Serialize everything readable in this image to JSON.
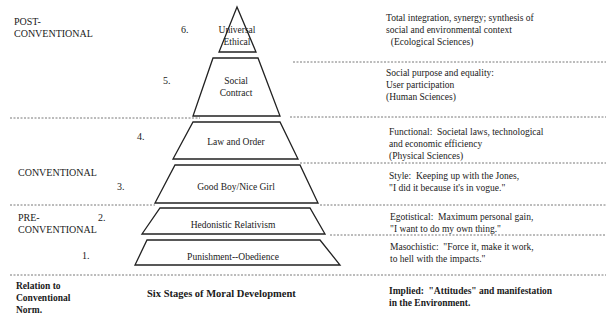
{
  "levels": [
    {
      "id": "post",
      "label_line1": "POST-",
      "label_line2": "CONVENTIONAL"
    },
    {
      "id": "conv",
      "label_line1": "CONVENTIONAL"
    },
    {
      "id": "pre",
      "label_line1": "PRE-",
      "label_line2": "CONVENTIONAL"
    }
  ],
  "stages": [
    {
      "number": "6.",
      "name_line1": "Universal",
      "name_line2": "Ethical",
      "desc": [
        "Total integration, synergy; synthesis of",
        "social and environmental context",
        "  (Ecological Sciences)"
      ]
    },
    {
      "number": "5.",
      "name_line1": "Social",
      "name_line2": "Contract",
      "desc": [
        "Social purpose and equality:",
        "User participation",
        "(Human Sciences)"
      ]
    },
    {
      "number": "4.",
      "name_line1": "Law and Order",
      "desc": [
        "Functional:  Societal laws, technological",
        "and economic efficiency",
        "(Physical Sciences)"
      ]
    },
    {
      "number": "3.",
      "name_line1": "Good Boy/Nice Girl",
      "desc": [
        "Style:  Keeping up with the Jones,",
        "\"I did it because it's in vogue.\""
      ]
    },
    {
      "number": "2.",
      "name_line1": "Hedonistic Relativism",
      "desc": [
        "Egotistical:  Maximum personal gain,",
        "\"I want to do my own thing.\""
      ]
    },
    {
      "number": "1.",
      "name_line1": "Punishment--Obedience",
      "desc": [
        "Masochistic:  \"Force it, make it work,",
        "to hell with the impacts.\""
      ]
    }
  ],
  "footer": {
    "left": [
      "Relation to",
      "Conventional",
      "Norm."
    ],
    "center": "Six Stages of Moral Development",
    "right": [
      "Implied:  \"Attitudes\" and manifestation",
      "in the Environment."
    ]
  }
}
